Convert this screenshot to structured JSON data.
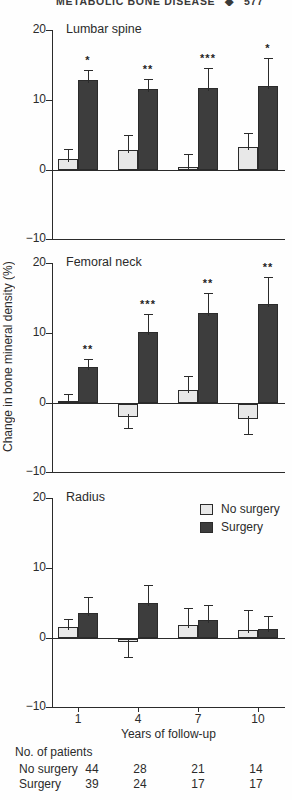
{
  "page": {
    "running_head": "METABOLIC BONE DISEASE",
    "separator": "◆",
    "page_number": "577"
  },
  "axis": {
    "y_label": "Change in bone mineral density (%)",
    "x_label": "Years of follow-up",
    "y_ticks": [
      "20",
      "10",
      "0",
      "−10"
    ],
    "ylim": [
      -10,
      20
    ],
    "categories": [
      "1",
      "4",
      "7",
      "10"
    ]
  },
  "legend": {
    "position": "top-right-of-radius-panel",
    "items": [
      {
        "label": "No surgery",
        "color": "#e8e8e8"
      },
      {
        "label": "Surgery",
        "color": "#3d3d3d"
      }
    ]
  },
  "chart_data": [
    {
      "type": "bar",
      "title": "Lumbar spine",
      "categories": [
        "1",
        "4",
        "7",
        "10"
      ],
      "ylim": [
        -10,
        20
      ],
      "grid": false,
      "series": [
        {
          "name": "No surgery",
          "values": [
            1.5,
            2.8,
            0.4,
            3.3
          ],
          "errors": [
            1.4,
            2.1,
            1.9,
            2.0
          ],
          "sig": [
            "",
            "",
            "",
            ""
          ]
        },
        {
          "name": "Surgery",
          "values": [
            12.9,
            11.5,
            11.7,
            12.0
          ],
          "errors": [
            1.4,
            1.4,
            2.8,
            4.0
          ],
          "sig": [
            "*",
            "**",
            "***",
            "*"
          ]
        }
      ]
    },
    {
      "type": "bar",
      "title": "Femoral neck",
      "categories": [
        "1",
        "4",
        "7",
        "10"
      ],
      "ylim": [
        -10,
        20
      ],
      "grid": false,
      "series": [
        {
          "name": "No surgery",
          "values": [
            0.3,
            -1.8,
            1.8,
            -2.1
          ],
          "errors": [
            1.0,
            1.6,
            2.0,
            2.1
          ],
          "sig": [
            "",
            "",
            "",
            ""
          ]
        },
        {
          "name": "Surgery",
          "values": [
            5.2,
            10.1,
            12.9,
            14.1
          ],
          "errors": [
            1.1,
            2.6,
            2.9,
            3.9
          ],
          "sig": [
            "**",
            "***",
            "**",
            "**"
          ]
        }
      ]
    },
    {
      "type": "bar",
      "title": "Radius",
      "categories": [
        "1",
        "4",
        "7",
        "10"
      ],
      "ylim": [
        -10,
        20
      ],
      "grid": false,
      "series": [
        {
          "name": "No surgery",
          "values": [
            1.5,
            -0.4,
            1.9,
            1.1
          ],
          "errors": [
            1.2,
            2.2,
            2.4,
            2.9
          ],
          "sig": [
            "",
            "",
            "",
            ""
          ]
        },
        {
          "name": "Surgery",
          "values": [
            3.6,
            5.0,
            2.6,
            1.3
          ],
          "errors": [
            2.3,
            2.6,
            2.1,
            1.8
          ],
          "sig": [
            "",
            "",
            "",
            ""
          ]
        }
      ]
    }
  ],
  "patients_table": {
    "title": "No. of patients",
    "rows": [
      {
        "label": "No surgery",
        "values": [
          44,
          28,
          21,
          14
        ]
      },
      {
        "label": "Surgery",
        "values": [
          39,
          24,
          17,
          17
        ]
      }
    ]
  },
  "colors": {
    "ink": "#2b2b2b",
    "bar_no_surgery": "#e8e8e8",
    "bar_surgery": "#3d3d3d",
    "background": "#fefefe"
  }
}
